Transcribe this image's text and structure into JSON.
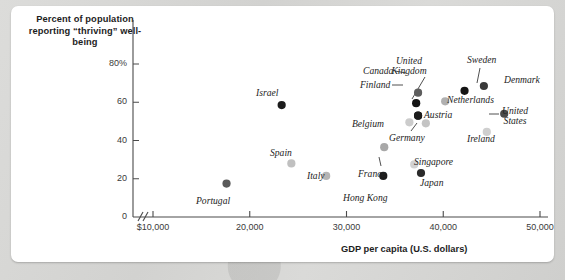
{
  "chart_data": {
    "type": "scatter",
    "title": "Percent of population reporting “thriving” well-being",
    "xlabel": "GDP per capita (U.S. dollars)",
    "ylabel": "Percent of population reporting “thriving” well-being",
    "xlim": [
      10000,
      51000
    ],
    "ylim": [
      0,
      88
    ],
    "grid": false,
    "legend": "none",
    "axis_break_x": true,
    "x_ticks": [
      {
        "value": 10000,
        "label": "$10,000"
      },
      {
        "value": 20000,
        "label": "20,000"
      },
      {
        "value": 30000,
        "label": "30,000"
      },
      {
        "value": 40000,
        "label": "40,000"
      },
      {
        "value": 50000,
        "label": "50,000"
      }
    ],
    "y_ticks": [
      {
        "value": 0,
        "label": "0"
      },
      {
        "value": 20,
        "label": "20"
      },
      {
        "value": 40,
        "label": "40"
      },
      {
        "value": 60,
        "label": "60"
      },
      {
        "value": 80,
        "label": "80%"
      }
    ],
    "points": [
      {
        "name": "Portugal",
        "x": 17600,
        "y": 17.5,
        "color": "#5a5a5a"
      },
      {
        "name": "Israel",
        "x": 23300,
        "y": 58.5,
        "color": "#1c1c1c"
      },
      {
        "name": "Spain",
        "x": 24300,
        "y": 28.0,
        "color": "#c0c0c0"
      },
      {
        "name": "Italy",
        "x": 27900,
        "y": 21.5,
        "color": "#b5b5b5"
      },
      {
        "name": "Hong Kong",
        "x": 33800,
        "y": 21.5,
        "color": "#1c1c1c"
      },
      {
        "name": "France",
        "x": 33900,
        "y": 36.5,
        "color": "#a8a8a8"
      },
      {
        "name": "Belgium",
        "x": 36500,
        "y": 49.5,
        "color": "#cccccc"
      },
      {
        "name": "Germany",
        "x": 38200,
        "y": 49.0,
        "color": "#c4c4c4"
      },
      {
        "name": "Singapore",
        "x": 37000,
        "y": 27.5,
        "color": "#d2d2d2"
      },
      {
        "name": "Japan",
        "x": 37700,
        "y": 23.0,
        "color": "#2a2a2a"
      },
      {
        "name": "Canada",
        "x": 37400,
        "y": 65.0,
        "color": "#5e5e5e"
      },
      {
        "name": "Finland",
        "x": 37200,
        "y": 59.5,
        "color": "#141414"
      },
      {
        "name": "United Kingdom",
        "x": 37400,
        "y": 53.0,
        "color": "#1c1c1c"
      },
      {
        "name": "Austria",
        "x": 37400,
        "y": 53.0,
        "color": "#1c1c1c"
      },
      {
        "name": "Netherlands",
        "x": 40200,
        "y": 60.5,
        "color": "#b0b0b0"
      },
      {
        "name": "Sweden",
        "x": 42200,
        "y": 66.0,
        "color": "#141414"
      },
      {
        "name": "Denmark",
        "x": 44200,
        "y": 68.5,
        "color": "#3a3a3a"
      },
      {
        "name": "Ireland",
        "x": 44500,
        "y": 44.5,
        "color": "#cfcfcf"
      },
      {
        "name": "United States",
        "x": 46300,
        "y": 54.0,
        "color": "#4a4a4a"
      }
    ],
    "labels": [
      {
        "text": "Portugal",
        "left": 196,
        "top": 196,
        "align": "left"
      },
      {
        "text": "Israel",
        "left": 256,
        "top": 88,
        "align": "left"
      },
      {
        "text": "Spain",
        "left": 270,
        "top": 148,
        "align": "left"
      },
      {
        "text": "Italy",
        "left": 307,
        "top": 171,
        "align": "left"
      },
      {
        "text": "Hong Kong",
        "left": 343,
        "top": 193,
        "align": "left"
      },
      {
        "text": "France",
        "left": 358,
        "top": 169,
        "align": "left"
      },
      {
        "text": "Singapore",
        "left": 414,
        "top": 157,
        "align": "left"
      },
      {
        "text": "Japan",
        "left": 420,
        "top": 178,
        "align": "left"
      },
      {
        "text": "Belgium",
        "left": 352,
        "top": 119,
        "align": "left"
      },
      {
        "text": "Germany",
        "left": 389,
        "top": 133,
        "align": "left"
      },
      {
        "text": "Canada",
        "left": 363,
        "top": 66,
        "align": "left"
      },
      {
        "text": "Finland",
        "left": 360,
        "top": 80,
        "align": "left"
      },
      {
        "text": "Austria",
        "left": 424,
        "top": 110,
        "align": "left"
      },
      {
        "text": "Netherlands",
        "left": 447,
        "top": 95,
        "align": "left"
      },
      {
        "text": "Denmark",
        "left": 504,
        "top": 75,
        "align": "left"
      },
      {
        "text": "Ireland",
        "left": 467,
        "top": 134,
        "align": "left"
      },
      {
        "text": "Sweden",
        "left": 467,
        "top": 55,
        "align": "left"
      },
      {
        "text": "United\nKingdom",
        "left": 409,
        "top": 56,
        "align": "center"
      },
      {
        "text": "United\nStates",
        "left": 502,
        "top": 106,
        "align": "left"
      }
    ],
    "leader_lines": [
      {
        "from_label": "United Kingdom",
        "x1": 425,
        "y1": 77,
        "x2": 412,
        "y2": 99
      },
      {
        "from_label": "Sweden",
        "x1": 480,
        "y1": 68,
        "x2": 477,
        "y2": 83
      },
      {
        "from_label": "Canada",
        "x1": 395,
        "y1": 71,
        "x2": 406,
        "y2": 73
      },
      {
        "from_label": "Finland",
        "x1": 392,
        "y1": 85,
        "x2": 403,
        "y2": 85
      },
      {
        "from_label": "France",
        "x1": 381,
        "y1": 166,
        "x2": 379,
        "y2": 157
      },
      {
        "from_label": "Germany",
        "x1": 411,
        "y1": 131,
        "x2": 417,
        "y2": 123
      },
      {
        "from_label": "United States",
        "x1": 499,
        "y1": 114,
        "x2": 489,
        "y2": 114
      }
    ]
  }
}
